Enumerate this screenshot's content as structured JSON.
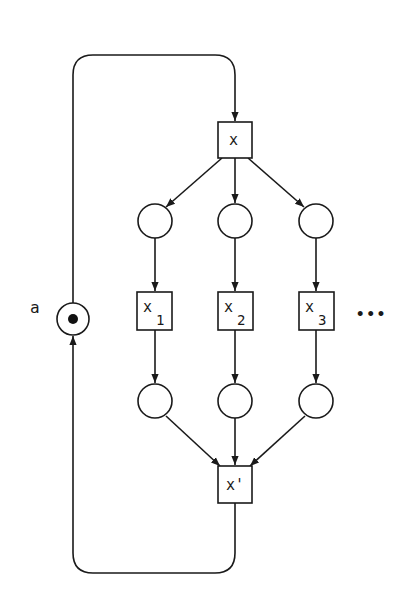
{
  "diagram": {
    "type": "petri-net",
    "colors": {
      "stroke": "#1a1a1a",
      "background": "#ffffff",
      "token": "#111111"
    },
    "places": [
      {
        "id": "a",
        "label": "a",
        "tokens": 1,
        "cx": 73,
        "cy": 319,
        "r": 16
      },
      {
        "id": "p1",
        "label": "",
        "tokens": 0,
        "cx": 155,
        "cy": 221,
        "r": 17
      },
      {
        "id": "p2",
        "label": "",
        "tokens": 0,
        "cx": 235,
        "cy": 221,
        "r": 17
      },
      {
        "id": "p3",
        "label": "",
        "tokens": 0,
        "cx": 316,
        "cy": 221,
        "r": 17
      },
      {
        "id": "q1",
        "label": "",
        "tokens": 0,
        "cx": 155,
        "cy": 401,
        "r": 17
      },
      {
        "id": "q2",
        "label": "",
        "tokens": 0,
        "cx": 235,
        "cy": 401,
        "r": 17
      },
      {
        "id": "q3",
        "label": "",
        "tokens": 0,
        "cx": 316,
        "cy": 401,
        "r": 17
      }
    ],
    "transitions": [
      {
        "id": "x",
        "label": "x",
        "sub": "",
        "x": 218,
        "y": 122,
        "w": 34,
        "h": 36
      },
      {
        "id": "x1",
        "label": "x",
        "sub": "1",
        "x": 137,
        "y": 292,
        "w": 35,
        "h": 38
      },
      {
        "id": "x2",
        "label": "x",
        "sub": "2",
        "x": 218,
        "y": 292,
        "w": 35,
        "h": 38
      },
      {
        "id": "x3",
        "label": "x",
        "sub": "3",
        "x": 299,
        "y": 292,
        "w": 35,
        "h": 38
      },
      {
        "id": "xprime",
        "label": "x'",
        "sub": "",
        "x": 218,
        "y": 466,
        "w": 34,
        "h": 37
      }
    ],
    "ellipsis": "•••",
    "arcs": [
      [
        "a",
        "x"
      ],
      [
        "x",
        "p1"
      ],
      [
        "x",
        "p2"
      ],
      [
        "x",
        "p3"
      ],
      [
        "p1",
        "x1"
      ],
      [
        "p2",
        "x2"
      ],
      [
        "p3",
        "x3"
      ],
      [
        "x1",
        "q1"
      ],
      [
        "x2",
        "q2"
      ],
      [
        "x3",
        "q3"
      ],
      [
        "q1",
        "xprime"
      ],
      [
        "q2",
        "xprime"
      ],
      [
        "q3",
        "xprime"
      ],
      [
        "xprime",
        "a"
      ]
    ]
  }
}
